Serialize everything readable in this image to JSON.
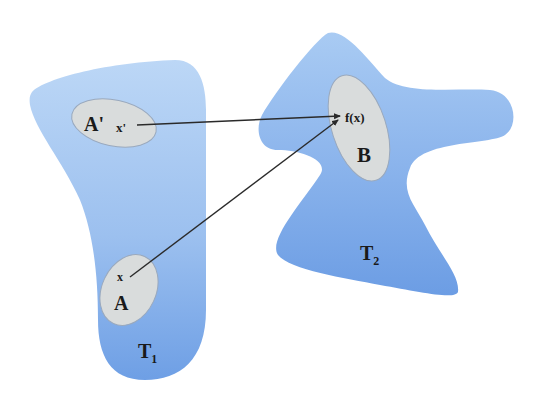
{
  "diagram": {
    "colors": {
      "background": "#ffffff",
      "space_fill_top": "#b9d5f5",
      "space_fill_bottom": "#6d9fe6",
      "subset_fill": "#d9dcdc",
      "subset_stroke": "#8fa0b5",
      "arrow": "#2a2a2a",
      "text": "#1a1a1a"
    },
    "spaces": [
      {
        "id": "T1",
        "label": "T",
        "subscript": "1"
      },
      {
        "id": "T2",
        "label": "T",
        "subscript": "2"
      }
    ],
    "subsets": [
      {
        "id": "A_prime",
        "label": "A'",
        "point_label": "x'",
        "in_space": "T1"
      },
      {
        "id": "A",
        "label": "A",
        "point_label": "x",
        "in_space": "T1"
      },
      {
        "id": "B",
        "label": "B",
        "point_label": "f(x)",
        "in_space": "T2"
      }
    ],
    "arrows": [
      {
        "from": "x'",
        "to": "f(x)"
      },
      {
        "from": "x",
        "to": "f(x)"
      }
    ]
  }
}
